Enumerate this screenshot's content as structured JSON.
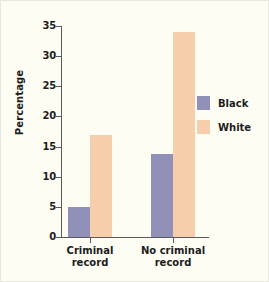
{
  "chart_data": {
    "type": "bar",
    "title": "",
    "xlabel": "",
    "ylabel": "Percentage",
    "categories": [
      "Criminal record",
      "No criminal record"
    ],
    "category_lines": [
      [
        "Criminal",
        "record"
      ],
      [
        "No criminal",
        "record"
      ]
    ],
    "series": [
      {
        "name": "Black",
        "color": "#9090b8",
        "values": [
          5,
          13.8
        ]
      },
      {
        "name": "White",
        "color": "#f6ceac",
        "values": [
          17,
          34
        ]
      }
    ],
    "ylim": [
      0,
      35
    ],
    "yticks": [
      0,
      5,
      10,
      15,
      20,
      25,
      30,
      35
    ],
    "ytick_labels": [
      "0",
      "5",
      "10",
      "15",
      "20",
      "25",
      "30",
      "35"
    ],
    "grid": false,
    "legend_position": "right"
  },
  "colors": {
    "background": "#fdfdf3",
    "axis": "#5b5b5b",
    "text": "#1c1c1c",
    "black_series": "#9090b8",
    "white_series": "#f6ceac"
  }
}
